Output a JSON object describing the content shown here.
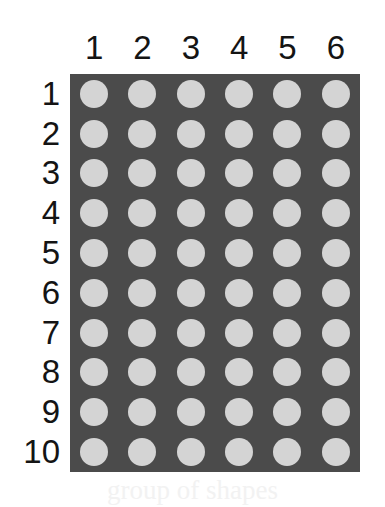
{
  "figure": {
    "colors": {
      "page_background": "#ffffff",
      "panel_background": "#4b4b4b",
      "dot_fill": "#d4d4d4",
      "label_text": "#141414"
    }
  },
  "chart_data": {
    "type": "heatmap",
    "title": "",
    "subtitle": "",
    "xlabel": "",
    "ylabel": "",
    "grid": false,
    "legend": "none",
    "columns": [
      "1",
      "2",
      "3",
      "4",
      "5",
      "6"
    ],
    "rows": [
      "1",
      "2",
      "3",
      "4",
      "5",
      "6",
      "7",
      "8",
      "9",
      "10"
    ],
    "n_columns": 6,
    "n_rows": 10,
    "cell_marker": "filled-circle",
    "values": [
      [
        1,
        1,
        1,
        1,
        1,
        1
      ],
      [
        1,
        1,
        1,
        1,
        1,
        1
      ],
      [
        1,
        1,
        1,
        1,
        1,
        1
      ],
      [
        1,
        1,
        1,
        1,
        1,
        1
      ],
      [
        1,
        1,
        1,
        1,
        1,
        1
      ],
      [
        1,
        1,
        1,
        1,
        1,
        1
      ],
      [
        1,
        1,
        1,
        1,
        1,
        1
      ],
      [
        1,
        1,
        1,
        1,
        1,
        1
      ],
      [
        1,
        1,
        1,
        1,
        1,
        1
      ],
      [
        1,
        1,
        1,
        1,
        1,
        1
      ]
    ]
  },
  "artifact": {
    "bleed_text": "group of shapes"
  }
}
